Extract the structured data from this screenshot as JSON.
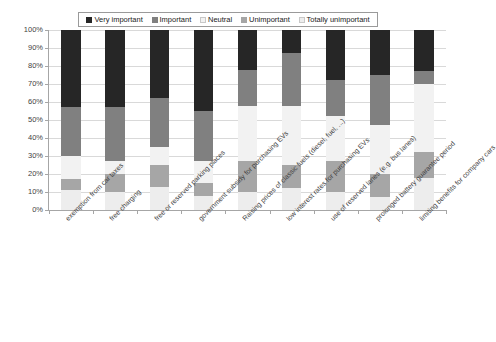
{
  "chart_data": {
    "type": "bar",
    "subtype": "stacked-100-percent",
    "title": "",
    "xlabel": "",
    "ylabel": "",
    "ylim": [
      0,
      100
    ],
    "ytick_labels": [
      "0%",
      "10%",
      "20%",
      "30%",
      "40%",
      "50%",
      "60%",
      "70%",
      "80%",
      "90%",
      "100%"
    ],
    "ytick_values": [
      0,
      10,
      20,
      30,
      40,
      50,
      60,
      70,
      80,
      90,
      100
    ],
    "grid": true,
    "legend_position": "top",
    "categories": [
      "exemption from car taxes",
      "free charging",
      "free or reserved parking places",
      "government subsidy for purchasing EVs",
      "Raising prices of classic fuels (diesel, fuel, ...)",
      "low interest rates for purchasing EVs",
      "use of reserved lanes (e.g. bus lanes)",
      "prolonged battery guarantee period",
      "limiting benefits for company cars"
    ],
    "series": [
      {
        "name": "Very important",
        "color": "#262626",
        "values": [
          43,
          43,
          38,
          45,
          22,
          13,
          28,
          25,
          23
        ]
      },
      {
        "name": "Important",
        "color": "#808080",
        "values": [
          27,
          30,
          27,
          28,
          20,
          29,
          20,
          28,
          7
        ]
      },
      {
        "name": "Neutral",
        "color": "#f2f2f2",
        "values": [
          13,
          7,
          10,
          12,
          31,
          33,
          25,
          27,
          38
        ]
      },
      {
        "name": "Unimportant",
        "color": "#a6a6a6",
        "values": [
          6,
          10,
          12,
          7,
          17,
          13,
          17,
          13,
          14
        ]
      },
      {
        "name": "Totally unimportant",
        "color": "#ededed",
        "values": [
          11,
          10,
          13,
          8,
          10,
          12,
          10,
          7,
          18
        ]
      }
    ]
  },
  "legend": {
    "items": [
      {
        "label": "Very important",
        "color": "#262626"
      },
      {
        "label": "Important",
        "color": "#808080"
      },
      {
        "label": "Neutral",
        "color": "#f2f2f2"
      },
      {
        "label": "Unimportant",
        "color": "#a6a6a6"
      },
      {
        "label": "Totally unimportant",
        "color": "#ededed"
      }
    ]
  }
}
